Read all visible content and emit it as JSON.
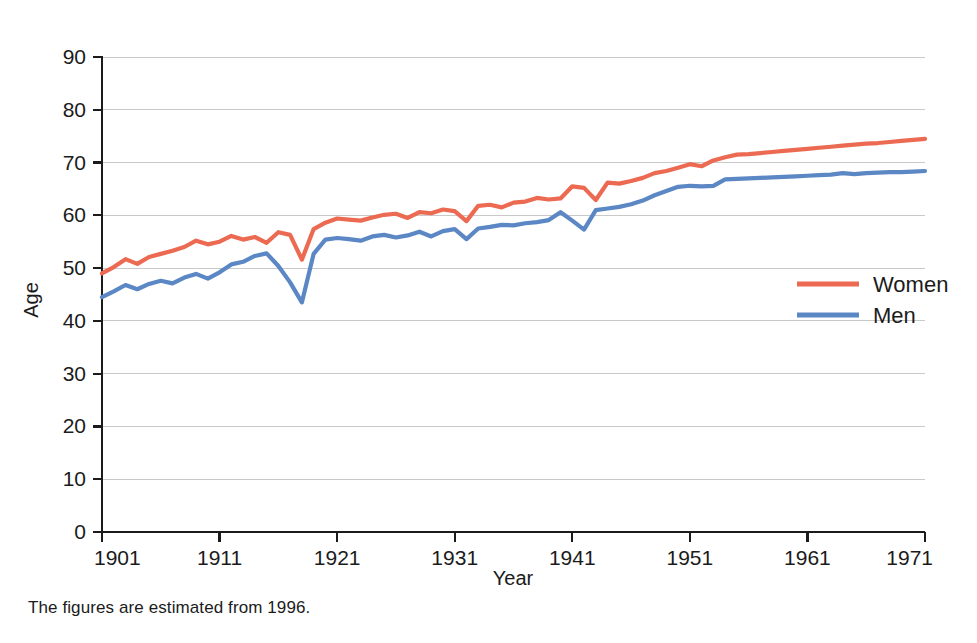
{
  "caption": "The figures are estimated from 1996.",
  "legend": {
    "position": "right-middle",
    "entries": [
      {
        "label": "Women",
        "color": "#ec6a52",
        "icon": "line-swatch-icon"
      },
      {
        "label": "Men",
        "color": "#5b87c5",
        "icon": "line-swatch-icon"
      }
    ]
  },
  "chart_data": {
    "type": "line",
    "title": "",
    "subtitle": "",
    "xlabel": "Year",
    "ylabel": "Age",
    "xlim": [
      1901,
      1971
    ],
    "ylim": [
      0,
      90
    ],
    "yticks": [
      0,
      10,
      20,
      30,
      40,
      50,
      60,
      70,
      80,
      90
    ],
    "ytick_labels": [
      "0",
      "10",
      "20",
      "30",
      "40",
      "50",
      "60",
      "70",
      "80",
      "90"
    ],
    "xticks": [
      1901,
      1911,
      1921,
      1931,
      1941,
      1951,
      1961,
      1971
    ],
    "xtick_labels": [
      "1901",
      "1911",
      "1921",
      "1931",
      "1941",
      "1951",
      "1961",
      "1971"
    ],
    "grid": "horizontal",
    "legend": [
      "Women",
      "Men"
    ],
    "annotations": [
      "The figures are estimated from 1996."
    ],
    "x": [
      1901,
      1902,
      1903,
      1904,
      1905,
      1906,
      1907,
      1908,
      1909,
      1910,
      1911,
      1912,
      1913,
      1914,
      1915,
      1916,
      1917,
      1918,
      1919,
      1920,
      1921,
      1922,
      1923,
      1924,
      1925,
      1926,
      1927,
      1928,
      1929,
      1930,
      1931,
      1932,
      1933,
      1934,
      1935,
      1936,
      1937,
      1938,
      1939,
      1940,
      1941,
      1942,
      1943,
      1944,
      1945,
      1946,
      1947,
      1948,
      1949,
      1950,
      1951,
      1952,
      1953,
      1954,
      1955,
      1956,
      1957,
      1958,
      1959,
      1960,
      1961,
      1962,
      1963,
      1964,
      1965,
      1966,
      1967,
      1968,
      1969,
      1970,
      1971
    ],
    "series": [
      {
        "name": "Women",
        "color": "#ec6a52",
        "values": [
          49.0,
          50.2,
          51.7,
          50.8,
          52.1,
          52.7,
          53.3,
          54.0,
          55.2,
          54.5,
          55.0,
          56.1,
          55.4,
          55.9,
          54.8,
          56.8,
          56.3,
          51.6,
          57.4,
          58.6,
          59.4,
          59.2,
          59.0,
          59.6,
          60.1,
          60.3,
          59.5,
          60.6,
          60.4,
          61.1,
          60.8,
          58.9,
          61.8,
          62.0,
          61.5,
          62.4,
          62.6,
          63.3,
          63.0,
          63.2,
          65.5,
          65.2,
          62.9,
          66.2,
          66.0,
          66.5,
          67.1,
          68.0,
          68.4,
          69.0,
          69.7,
          69.3,
          70.4,
          71.0,
          71.5,
          71.6,
          71.8,
          72.0,
          72.2,
          72.4,
          72.6,
          72.8,
          73.0,
          73.2,
          73.4,
          73.6,
          73.7,
          73.9,
          74.1,
          74.3,
          74.5
        ]
      },
      {
        "name": "Men",
        "color": "#5b87c5",
        "values": [
          44.5,
          45.6,
          46.8,
          46.0,
          47.0,
          47.6,
          47.1,
          48.2,
          48.9,
          48.0,
          49.2,
          50.7,
          51.2,
          52.3,
          52.8,
          50.4,
          47.3,
          43.5,
          52.7,
          55.4,
          55.7,
          55.5,
          55.2,
          56.0,
          56.3,
          55.8,
          56.2,
          56.9,
          56.0,
          57.0,
          57.4,
          55.5,
          57.5,
          57.8,
          58.2,
          58.1,
          58.5,
          58.7,
          59.1,
          60.6,
          59.0,
          57.3,
          61.0,
          61.3,
          61.6,
          62.1,
          62.8,
          63.8,
          64.6,
          65.4,
          65.6,
          65.5,
          65.6,
          66.8,
          66.9,
          67.0,
          67.1,
          67.2,
          67.3,
          67.4,
          67.5,
          67.6,
          67.7,
          68.0,
          67.8,
          68.0,
          68.1,
          68.2,
          68.2,
          68.3,
          68.4
        ]
      }
    ]
  }
}
